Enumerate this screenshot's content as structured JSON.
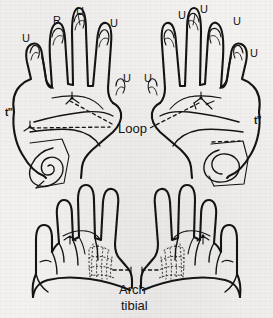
{
  "figure": {
    "ink_color": "#141414",
    "paper_color": "#f3f2f0",
    "width": 273,
    "height": 318
  },
  "hands": {
    "left": {
      "name": "left-hand",
      "digit_labels": [
        {
          "id": "left-thumb",
          "text": "U",
          "x": 22,
          "y": 33
        },
        {
          "id": "left-index",
          "text": "R",
          "x": 53,
          "y": 15
        },
        {
          "id": "left-middle",
          "text": "U",
          "x": 76,
          "y": 6
        },
        {
          "id": "left-ring",
          "text": "U",
          "x": 110,
          "y": 18
        },
        {
          "id": "left-little",
          "text": "U",
          "x": 123,
          "y": 73
        }
      ],
      "triradius_label": {
        "id": "left-triradius",
        "text": "t\"",
        "x": 5,
        "y": 108
      },
      "palm_pattern": "whorl-spiral"
    },
    "right": {
      "name": "right-hand",
      "digit_labels": [
        {
          "id": "right-little",
          "text": "U",
          "x": 144,
          "y": 73
        },
        {
          "id": "right-thumb",
          "text": "U",
          "x": 178,
          "y": 10
        },
        {
          "id": "right-index",
          "text": "U",
          "x": 200,
          "y": 4
        },
        {
          "id": "right-middle",
          "text": "U",
          "x": 233,
          "y": 16
        },
        {
          "id": "right-ring",
          "text": "U",
          "x": 250,
          "y": 48
        }
      ],
      "triradius_label": {
        "id": "right-triradius",
        "text": "t\"",
        "x": 254,
        "y": 116
      },
      "palm_pattern": "loop-concentric"
    }
  },
  "annotations": {
    "loop": {
      "text": "Loop",
      "x": 118,
      "y": 122
    },
    "arch_line1": {
      "text": "Arch",
      "x": 119,
      "y": 283
    },
    "arch_line2": {
      "text": "tibial",
      "x": 121,
      "y": 299
    }
  },
  "feet": {
    "left": {
      "name": "left-foot",
      "sole_pattern": "arch-tibial-stipple"
    },
    "right": {
      "name": "right-foot",
      "sole_pattern": "arch-tibial-stipple"
    }
  }
}
